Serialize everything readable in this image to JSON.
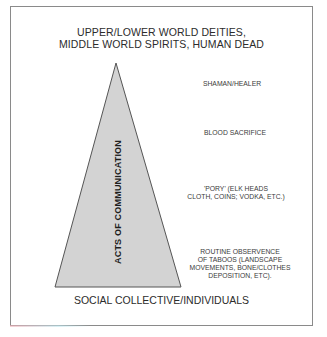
{
  "diagram": {
    "title_lines": [
      "UPPER/LOWER WORLD DEITIES,",
      "MIDDLE WORLD SPIRITS, HUMAN DEAD"
    ],
    "pyramid": {
      "axis_label": "ACTS OF COMMUNICATION",
      "fill_color": "#d3d3d3",
      "stroke_color": "#555555"
    },
    "levels": [
      {
        "label_lines": [
          "SHAMAN/HEALER"
        ]
      },
      {
        "label_lines": [
          "BLOOD SACRIFICE"
        ]
      },
      {
        "label_lines": [
          "'PORY' (ELK HEADS",
          "CLOTH, COINS; VODKA, ETC.)"
        ]
      },
      {
        "label_lines": [
          "ROUTINE OBSERVENCE",
          "OF TABOOS (LANDSCAPE",
          "MOVEMENTS, BONE/CLOTHES",
          "DEPOSITION, ETC)."
        ]
      }
    ],
    "base_label": "SOCIAL COLLECTIVE/INDIVIDUALS"
  }
}
